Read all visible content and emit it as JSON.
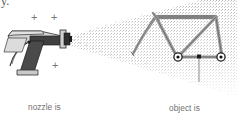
{
  "figure": {
    "title_fragment": "y.",
    "background_color": "#ffffff",
    "width": 237,
    "height": 125
  },
  "sprayer": {
    "name": "electrostatic-spray-gun",
    "body_color": "#d0d0d0",
    "handle_color": "#4a4a4a",
    "barrel_color": "#3c3c3c",
    "outline_color": "#2b2b2b",
    "nozzle_color": "#2f2f2f",
    "caption": "nozzle is\ncharged\npositively",
    "caption_lines": [
      "nozzle is",
      "charged",
      "positively"
    ],
    "caption_color": "#6f6f6f",
    "charge_symbols": [
      "+",
      "+",
      "+",
      "+"
    ],
    "charge_symbol_color": "#777777"
  },
  "spray": {
    "name": "charged-paint-droplet-cloud",
    "dot_color": "#9a9a9a",
    "description": "cone of fine positively charged droplets"
  },
  "object": {
    "name": "bicycle-frame-target",
    "tube_color": "#8a8a8a",
    "tube_outline": "#555555",
    "hub_color": "#1e1e1e",
    "caption": "object is\nnegative",
    "caption_lines": [
      "object is",
      "negative"
    ],
    "caption_color": "#6f6f6f"
  },
  "leader": {
    "name": "object-leader-line",
    "color": "#8a8a8a",
    "marker_color": "#1e1e1e"
  }
}
